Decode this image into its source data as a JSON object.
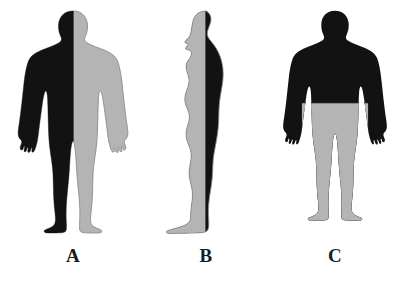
{
  "image": {
    "title": "Human body silhouettes divided by anatomical planes",
    "background_color": "#ffffff",
    "width": 404,
    "height": 283
  },
  "palette": {
    "dark": "#121212",
    "light": "#b4b4b4",
    "outline": "#8c8c8c",
    "label_color": "#1b1b1b",
    "background": "#ffffff"
  },
  "figures": [
    {
      "id": "figure-a",
      "label": "A",
      "view": "anterior",
      "plane": "sagittal",
      "description": "Front-facing human silhouette split vertically down the midline; left half dark, right half light",
      "dark_region": "left half",
      "light_region": "right half"
    },
    {
      "id": "figure-b",
      "label": "B",
      "view": "lateral",
      "plane": "coronal",
      "description": "Side-profile human silhouette facing left, split vertically; anterior half light, posterior half dark",
      "dark_region": "posterior half",
      "light_region": "anterior half"
    },
    {
      "id": "figure-c",
      "label": "C",
      "view": "anterior",
      "plane": "transverse",
      "description": "Front-facing human silhouette split horizontally at the waist; upper body and arms dark, lower body light",
      "dark_region": "upper body and arms",
      "light_region": "hips and legs"
    }
  ]
}
